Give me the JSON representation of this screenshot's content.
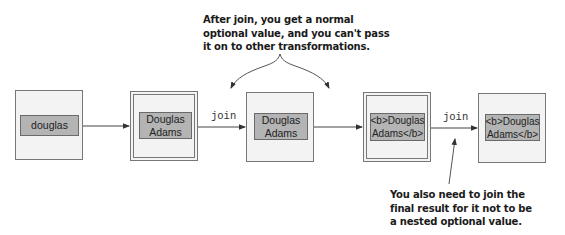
{
  "diagram": {
    "boxes": [
      {
        "id": "box-1",
        "kind": "single",
        "value": "douglas"
      },
      {
        "id": "box-2",
        "kind": "double",
        "value": "Douglas\nAdams"
      },
      {
        "id": "box-3",
        "kind": "single",
        "value": "Douglas\nAdams"
      },
      {
        "id": "box-4",
        "kind": "double",
        "value": "<b>Douglas\nAdams</b>"
      },
      {
        "id": "box-5",
        "kind": "single",
        "value": "<b>Douglas\nAdams</b>"
      }
    ],
    "operations": [
      {
        "from": "box-2",
        "to": "box-3",
        "label": "join"
      },
      {
        "from": "box-4",
        "to": "box-5",
        "label": "join"
      }
    ],
    "annotations": {
      "top": "After join, you get a normal\noptional value, and you can't pass\nit on to other transformations.",
      "bottom": "You also need to join the\nfinal result for it not to be\na nested optional value."
    },
    "colors": {
      "outer_fill": "#f3f3f3",
      "value_fill": "#b4b4b4",
      "stroke": "#777777",
      "arrow": "#333333"
    }
  }
}
